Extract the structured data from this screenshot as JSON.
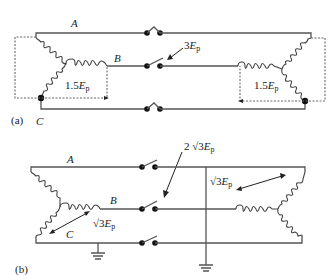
{
  "figure": {
    "panel_a": {
      "label": "(a)",
      "phases": {
        "A": "A",
        "B": "B",
        "C": "C"
      },
      "switch_voltage": {
        "coef": "3",
        "var": "E",
        "sub": "p"
      },
      "left_voltage": {
        "coef": "1.5",
        "var": "E",
        "sub": "p"
      },
      "right_voltage": {
        "coef": "1.5",
        "var": "E",
        "sub": "p"
      }
    },
    "panel_b": {
      "label": "(b)",
      "phases": {
        "A": "A",
        "B": "B",
        "C": "C"
      },
      "switch_voltage": {
        "coef": "2 √3",
        "var": "E",
        "sub": "p"
      },
      "left_voltage": {
        "coef": "√3",
        "var": "E",
        "sub": "p"
      },
      "right_voltage": {
        "coef": "√3",
        "var": "E",
        "sub": "p"
      }
    },
    "colors": {
      "line": "#555555",
      "coil": "#444444",
      "dot": "#111111",
      "text": "#222222"
    }
  }
}
